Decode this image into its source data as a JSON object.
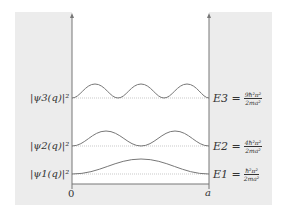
{
  "diagram": {
    "colors": {
      "wall_fill": "#ececec",
      "axis": "#777777",
      "curve": "#777777",
      "baseline_dotted": "#bbbbbb",
      "text": "#333333"
    },
    "x_axis": {
      "left_label": "0",
      "right_label": "a"
    },
    "levels": [
      {
        "n": 3,
        "left_label": "|ψ3(q)|²",
        "energy_lhs": "E3 =",
        "energy_num": "9ħ²π²",
        "energy_den": "2ma²",
        "humps": 3
      },
      {
        "n": 2,
        "left_label": "|ψ2(q)|²",
        "energy_lhs": "E2 =",
        "energy_num": "4ħ²π²",
        "energy_den": "2ma²",
        "humps": 2
      },
      {
        "n": 1,
        "left_label": "|ψ1(q)|²",
        "energy_lhs": "E1 =",
        "energy_num": "ħ²π²",
        "energy_den": "2ma²",
        "humps": 1
      }
    ]
  }
}
